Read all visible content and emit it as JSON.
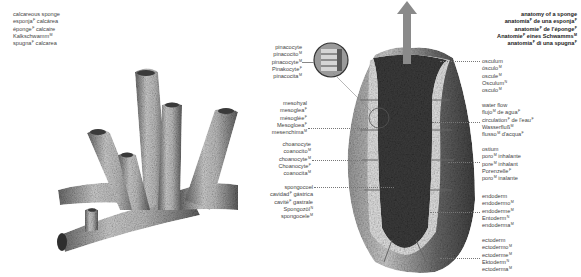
{
  "title_left": {
    "lines": [
      {
        "text": "calcareous sponge",
        "gender": ""
      },
      {
        "text": "esponja",
        "gender": "F",
        "rest": " calcárea"
      },
      {
        "text": "éponge",
        "gender": "F",
        "rest": " calcaire"
      },
      {
        "text": "Kalkschwamm",
        "gender": "M",
        "rest": ""
      },
      {
        "text": "spugna",
        "gender": "F",
        "rest": " calcarea"
      }
    ]
  },
  "title_right": {
    "lines": [
      {
        "text": "anatomy of a sponge",
        "gender": ""
      },
      {
        "text": "anatomía",
        "gender": "F",
        "rest": " de una esponja",
        "gender2": "F"
      },
      {
        "text": "anatomie",
        "gender": "F",
        "rest": " de l'éponge",
        "gender2": "F"
      },
      {
        "text": "Anatomie",
        "gender": "F",
        "rest": " eines Schwamms",
        "gender2": "M"
      },
      {
        "text": "anatomia",
        "gender": "F",
        "rest": " di una spugna",
        "gender2": "F"
      }
    ]
  },
  "labels_left": [
    {
      "id": "pinacocyte",
      "lines": [
        {
          "t": "pinacocyte",
          "g": ""
        },
        {
          "t": "pinacocito",
          "g": "M"
        },
        {
          "t": "pinacocyte",
          "g": "M"
        },
        {
          "t": "Pinakocyte",
          "g": "F"
        },
        {
          "t": "pinacocita",
          "g": "M"
        }
      ]
    },
    {
      "id": "mesohyl",
      "lines": [
        {
          "t": "mesohyal",
          "g": ""
        },
        {
          "t": "mesoglea",
          "g": "F"
        },
        {
          "t": "mésoglée",
          "g": "F"
        },
        {
          "t": "Mesogloea",
          "g": "F"
        },
        {
          "t": "mesenchima",
          "g": "M"
        }
      ]
    },
    {
      "id": "choanocyte",
      "lines": [
        {
          "t": "choanocyte",
          "g": ""
        },
        {
          "t": "coanocito",
          "g": "M"
        },
        {
          "t": "choanocyte",
          "g": "M"
        },
        {
          "t": "Choanocyte",
          "g": "F"
        },
        {
          "t": "coanocita",
          "g": "M"
        }
      ]
    },
    {
      "id": "spongocoel",
      "lines": [
        {
          "t": "spongocoel",
          "g": ""
        },
        {
          "t": "cavidad",
          "g": "F",
          "r": " gástrica"
        },
        {
          "t": "cavité",
          "g": "F",
          "r": " gastrale"
        },
        {
          "t": "Spongozöl",
          "g": "N"
        },
        {
          "t": "spongocele",
          "g": "M"
        }
      ]
    }
  ],
  "labels_right": [
    {
      "id": "osculum",
      "lines": [
        {
          "t": "osculum",
          "g": ""
        },
        {
          "t": "ósculo",
          "g": "M"
        },
        {
          "t": "oscule",
          "g": "M"
        },
        {
          "t": "Osculum",
          "g": "N"
        },
        {
          "t": "osculo",
          "g": "M"
        }
      ]
    },
    {
      "id": "water-flow",
      "lines": [
        {
          "t": "water flow",
          "g": ""
        },
        {
          "t": "flujo",
          "g": "M",
          "r": " de agua",
          "g2": "F"
        },
        {
          "t": "circulation",
          "g": "F",
          "r": " de l'eau",
          "g2": "F"
        },
        {
          "t": "Wasserfluß",
          "g": "M"
        },
        {
          "t": "flusso",
          "g": "M",
          "r": " d'acqua",
          "g2": "F"
        }
      ]
    },
    {
      "id": "ostium",
      "lines": [
        {
          "t": "ostium",
          "g": ""
        },
        {
          "t": "poro",
          "g": "M",
          "r": " inhalante"
        },
        {
          "t": "pore",
          "g": "M",
          "r": " inhalant"
        },
        {
          "t": "Porenzelle",
          "g": "F"
        },
        {
          "t": "poro",
          "g": "M",
          "r": " inalante"
        }
      ]
    },
    {
      "id": "endoderm",
      "lines": [
        {
          "t": "endoderm",
          "g": ""
        },
        {
          "t": "endodermo",
          "g": "M"
        },
        {
          "t": "endoderme",
          "g": "M"
        },
        {
          "t": "Entoderm",
          "g": "N"
        },
        {
          "t": "endoderma",
          "g": "M"
        }
      ]
    },
    {
      "id": "ectoderm",
      "lines": [
        {
          "t": "ectoderm",
          "g": ""
        },
        {
          "t": "ectodermo",
          "g": "M"
        },
        {
          "t": "ectoderme",
          "g": "M"
        },
        {
          "t": "Ektoderm",
          "g": "N"
        },
        {
          "t": "ectoderma",
          "g": "M"
        }
      ]
    }
  ],
  "illustrations": {
    "left": "calcareous-sponge-drawing",
    "right": "sponge-cross-section",
    "inset": "pinacocyte-magnified-inset",
    "arrow": "water-flow-arrow"
  },
  "colors": {
    "text": "#444444",
    "leader": "#777777",
    "sponge_light": "#d8d8d8",
    "sponge_dark": "#5a5a5a",
    "cavity": "#3c3c3c",
    "arrow": "#8a8a8a"
  }
}
